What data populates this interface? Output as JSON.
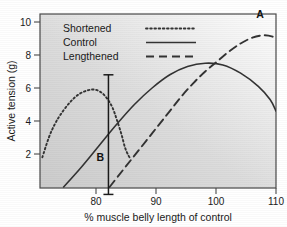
{
  "chart_data": {
    "type": "line",
    "title": "",
    "xlabel": "% muscle belly length of control",
    "ylabel": "Active tension (g)",
    "xlim": [
      70,
      110
    ],
    "ylim": [
      0,
      11
    ],
    "xticks": [
      80,
      90,
      100,
      110
    ],
    "yticks": [
      2,
      4,
      6,
      8,
      10
    ],
    "xtick_labels": [
      "80",
      "90",
      "100",
      "110"
    ],
    "ytick_labels": [
      "2",
      "4",
      "6",
      "8",
      "10"
    ],
    "grid": false,
    "legend_position": "top-left",
    "background": "diagonal-gradient-grey-to-white",
    "series": [
      {
        "name": "Shortened",
        "style": "dotted",
        "color": "#333333",
        "points": [
          [
            70.4,
            1.8
          ],
          [
            71.5,
            3.0
          ],
          [
            72.5,
            3.8
          ],
          [
            73.5,
            4.4
          ],
          [
            75.0,
            5.1
          ],
          [
            76.5,
            5.6
          ],
          [
            78.0,
            5.85
          ],
          [
            79.3,
            5.9
          ],
          [
            80.5,
            5.7
          ],
          [
            81.5,
            5.3
          ],
          [
            82.3,
            4.8
          ],
          [
            83.0,
            4.1
          ],
          [
            83.8,
            3.2
          ],
          [
            84.4,
            2.4
          ],
          [
            85.0,
            1.9
          ],
          [
            85.3,
            1.75
          ]
        ]
      },
      {
        "name": "Control",
        "style": "solid",
        "color": "#333333",
        "points": [
          [
            74.0,
            0.0
          ],
          [
            77.0,
            1.2
          ],
          [
            80.0,
            2.5
          ],
          [
            83.0,
            3.8
          ],
          [
            86.0,
            5.0
          ],
          [
            89.0,
            6.0
          ],
          [
            92.0,
            6.8
          ],
          [
            95.0,
            7.3
          ],
          [
            98.0,
            7.5
          ],
          [
            101.0,
            7.4
          ],
          [
            104.0,
            6.9
          ],
          [
            107.0,
            6.1
          ],
          [
            109.0,
            5.3
          ],
          [
            110.0,
            4.6
          ]
        ]
      },
      {
        "name": "Lengthened",
        "style": "dashed",
        "color": "#333333",
        "points": [
          [
            81.8,
            0.0
          ],
          [
            84.0,
            1.0
          ],
          [
            86.0,
            1.9
          ],
          [
            88.0,
            2.8
          ],
          [
            90.0,
            3.7
          ],
          [
            92.0,
            4.6
          ],
          [
            94.0,
            5.5
          ],
          [
            96.0,
            6.3
          ],
          [
            98.0,
            7.0
          ],
          [
            100.0,
            7.6
          ],
          [
            102.0,
            8.2
          ],
          [
            104.0,
            8.7
          ],
          [
            106.0,
            9.05
          ],
          [
            108.0,
            9.2
          ],
          [
            109.5,
            9.1
          ],
          [
            110.0,
            8.95
          ]
        ]
      }
    ],
    "annotations": [
      {
        "label": "A",
        "kind": "peak-label",
        "x": 107.8,
        "y": 9.2,
        "label_x": 107.3,
        "label_y": 10.25
      },
      {
        "label": "B",
        "kind": "vertical-bar-label",
        "x": 81.6,
        "y_top": 6.8,
        "y_bottom": -0.45,
        "label_x": 80.2,
        "label_y": 1.55
      }
    ]
  },
  "legend": {
    "entries": [
      {
        "label": "Shortened",
        "style": "dotted"
      },
      {
        "label": "Control",
        "style": "solid"
      },
      {
        "label": "Lengthened",
        "style": "dashed"
      }
    ]
  },
  "axes": {
    "x_title": "% muscle belly length of control",
    "y_title": "Active tension (g)"
  }
}
